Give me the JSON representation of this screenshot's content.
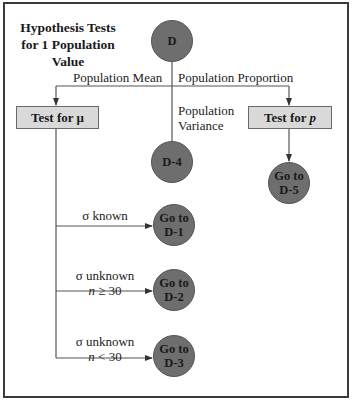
{
  "title": [
    "Hypothesis Tests",
    "for 1 Population",
    "Value"
  ],
  "root_node": {
    "label": "D"
  },
  "branches": {
    "mean": {
      "label": "Population Mean"
    },
    "proportion": {
      "label": "Population Proportion"
    },
    "variance": {
      "label_line1": "Population",
      "label_line2": "Variance"
    }
  },
  "boxes": {
    "test_mu": {
      "prefix": "Test for ",
      "symbol": "μ"
    },
    "test_p": {
      "prefix": "Test for ",
      "symbol": "p"
    }
  },
  "nodes": {
    "d4": {
      "line1": "D-4"
    },
    "d5": {
      "line1": "Go to",
      "line2": "D-5"
    },
    "d1": {
      "line1": "Go to",
      "line2": "D-1"
    },
    "d2": {
      "line1": "Go to",
      "line2": "D-2"
    },
    "d3": {
      "line1": "Go to",
      "line2": "D-3"
    }
  },
  "conditions": {
    "known": {
      "line1": "σ known"
    },
    "unknown_large": {
      "line1": "σ unknown",
      "var": "n",
      "op": " ≥ 30"
    },
    "unknown_small": {
      "line1": "σ unknown",
      "var": "n",
      "op": " < 30"
    }
  },
  "colors": {
    "node_fill": "#6e6e6e",
    "box_fill": "#d9d9d9",
    "line": "#555555",
    "frame": "#3a3a3a"
  }
}
